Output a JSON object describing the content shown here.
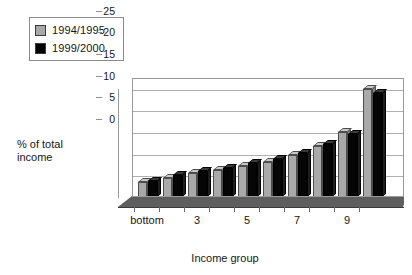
{
  "chart_data": {
    "type": "bar",
    "title": "",
    "xlabel": "Income group",
    "ylabel": "% of total income",
    "ylim": [
      0,
      27.5
    ],
    "yticks": [
      0,
      5,
      10,
      15,
      20,
      25
    ],
    "grid": true,
    "legend_position": "top-left",
    "categories": [
      "bottom",
      "2",
      "3",
      "4",
      "5",
      "6",
      "7",
      "8",
      "9",
      "top"
    ],
    "xtick_labels": [
      "bottom",
      "3",
      "5",
      "7",
      "9"
    ],
    "xtick_categories": [
      "bottom",
      "3",
      "5",
      "7",
      "9"
    ],
    "series": [
      {
        "name": "1994/1995",
        "color": "#a9a9a9",
        "values": [
          3.5,
          4.5,
          5.5,
          6.3,
          7.2,
          8.2,
          9.8,
          11.8,
          15.0,
          25.0
        ]
      },
      {
        "name": "1999/2000",
        "color": "#050505",
        "values": [
          3.8,
          5.0,
          5.9,
          6.8,
          7.8,
          8.7,
          10.2,
          12.2,
          14.6,
          24.0
        ]
      }
    ]
  },
  "legend": {
    "items": [
      {
        "label": "1994/1995",
        "swatch": "grey"
      },
      {
        "label": "1999/2000",
        "swatch": "black"
      }
    ]
  },
  "axes": {
    "y_title_line1": "% of total",
    "y_title_line2": "income",
    "x_title": "Income group"
  }
}
